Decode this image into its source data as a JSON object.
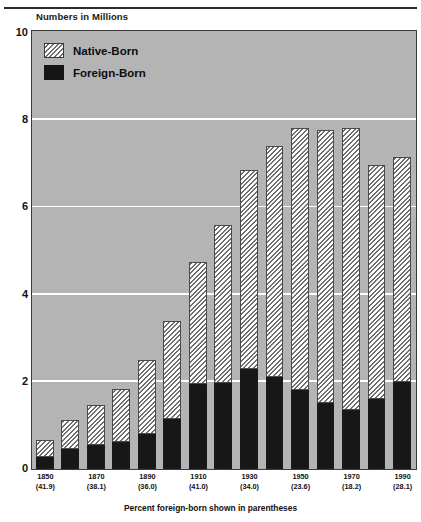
{
  "axis_title": "Numbers in Millions",
  "caption": "Percent foreign-born shown in parentheses",
  "legend": {
    "items": [
      {
        "label": "Native-Born",
        "key": "native",
        "color": "#ffffff"
      },
      {
        "label": "Foreign-Born",
        "key": "foreign",
        "color": "#151515"
      }
    ]
  },
  "colors": {
    "plot_background": "#b4b4b4",
    "gridline": "#ffffff",
    "frame": "#3a3a3a",
    "foreign_born": "#171717",
    "native_born_hatch": "#6f6f6f"
  },
  "chart_data": {
    "type": "bar",
    "title": "Numbers in Millions",
    "subtitle": "Percent foreign-born shown in parentheses",
    "xlabel": "",
    "ylabel": "Numbers in Millions",
    "ylim": [
      0,
      10
    ],
    "yticks": [
      0,
      2,
      4,
      6,
      8,
      10
    ],
    "grid": true,
    "legend_position": "top-left",
    "stacked": true,
    "categories": [
      "1850",
      "1860",
      "1870",
      "1880",
      "1890",
      "1900",
      "1910",
      "1920",
      "1930",
      "1940",
      "1950",
      "1960",
      "1970",
      "1980",
      "1990"
    ],
    "tick_labels": [
      {
        "year": "1850",
        "pct": "(41.9)"
      },
      {
        "year": "1870",
        "pct": "(38.1)"
      },
      {
        "year": "1890",
        "pct": "(36.0)"
      },
      {
        "year": "1910",
        "pct": "(41.0)"
      },
      {
        "year": "1930",
        "pct": "(34.0)"
      },
      {
        "year": "1950",
        "pct": "(23.6)"
      },
      {
        "year": "1970",
        "pct": "(18.2)"
      },
      {
        "year": "1990",
        "pct": "(28.1)"
      }
    ],
    "series": [
      {
        "name": "Foreign-Born",
        "values": [
          0.28,
          0.45,
          0.55,
          0.62,
          0.8,
          1.15,
          1.95,
          1.98,
          2.3,
          2.1,
          1.8,
          1.5,
          1.35,
          1.6,
          2.0
        ]
      },
      {
        "name": "Native-Born",
        "values": [
          0.39,
          0.68,
          0.92,
          1.22,
          1.7,
          2.25,
          2.8,
          3.6,
          4.55,
          5.3,
          6.0,
          6.25,
          6.45,
          5.35,
          5.15
        ]
      }
    ],
    "totals": [
      0.67,
      1.13,
      1.47,
      1.84,
      2.5,
      3.4,
      4.75,
      5.58,
      6.85,
      7.4,
      7.8,
      7.75,
      7.8,
      6.95,
      7.15
    ]
  }
}
